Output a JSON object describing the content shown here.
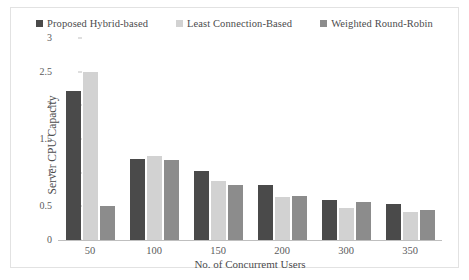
{
  "chart_data": {
    "type": "bar",
    "title": "",
    "xlabel": "No. of Concurremt Users",
    "ylabel": "Server CPU Capacity",
    "categories": [
      "50",
      "100",
      "150",
      "200",
      "300",
      "350"
    ],
    "series": [
      {
        "name": "Proposed Hybrid-based",
        "color": "#4a4a4a",
        "values": [
          2.22,
          1.2,
          1.02,
          0.82,
          0.6,
          0.53
        ]
      },
      {
        "name": "Least Connection-Based",
        "color": "#d2d2d2",
        "values": [
          2.5,
          1.25,
          0.87,
          0.64,
          0.48,
          0.41
        ]
      },
      {
        "name": "Weighted  Round-Robin",
        "color": "#8c8c8c",
        "values": [
          0.51,
          1.19,
          0.81,
          0.65,
          0.56,
          0.44
        ]
      }
    ],
    "ylim": [
      0,
      3
    ],
    "yticks": [
      "0",
      "0.5",
      "1",
      "1.5",
      "2",
      "2.5",
      "3"
    ],
    "ytick_values": [
      0,
      0.5,
      1,
      1.5,
      2,
      2.5,
      3
    ],
    "grid": false,
    "legend_position": "top"
  }
}
